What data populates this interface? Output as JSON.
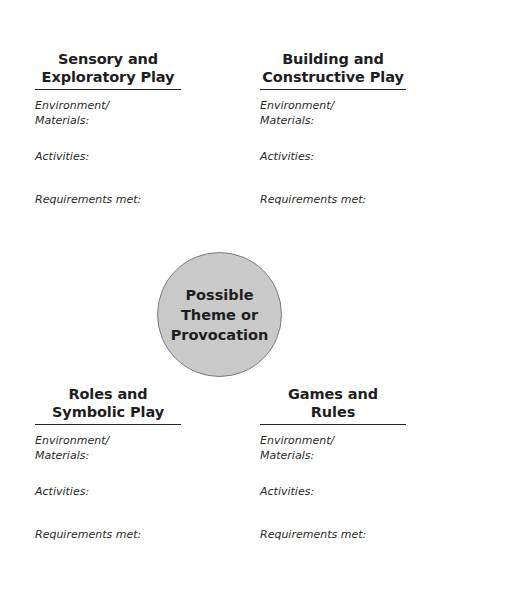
{
  "quadrants": {
    "top_left": {
      "title_line1": "Sensory and",
      "title_line2": "Exploratory Play",
      "environment_label": "Environment/ Materials:",
      "activities_label": "Activities:",
      "requirements_label": "Requirements met:"
    },
    "top_right": {
      "title_line1": "Building and",
      "title_line2": "Constructive Play",
      "environment_label": "Environment/ Materials:",
      "activities_label": "Activities:",
      "requirements_label": "Requirements met:"
    },
    "bottom_left": {
      "title_line1": "Roles and",
      "title_line2": "Symbolic Play",
      "environment_label": "Environment/ Materials:",
      "activities_label": "Activities:",
      "requirements_label": "Requirements met:"
    },
    "bottom_right": {
      "title_line1": "Games and",
      "title_line2": "Rules",
      "environment_label": "Environment/ Materials:",
      "activities_label": "Activities:",
      "requirements_label": "Requirements met:"
    }
  },
  "center": {
    "line1": "Possible",
    "line2": "Theme or",
    "line3": "Provocation",
    "fill_color": "#c9c9c9"
  }
}
